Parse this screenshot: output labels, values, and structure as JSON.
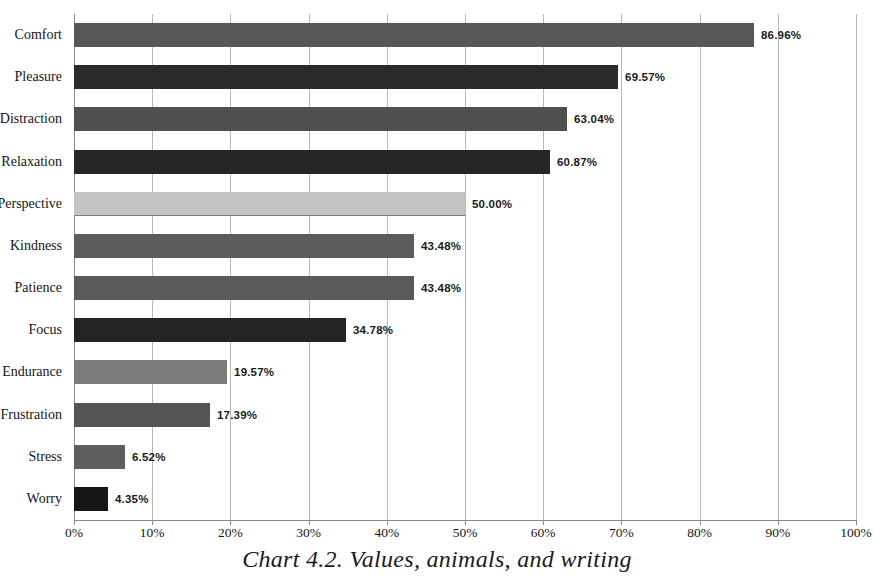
{
  "chart_data": {
    "type": "bar",
    "orientation": "horizontal",
    "title": "",
    "caption": "Chart 4.2. Values, animals, and writing",
    "xlabel": "",
    "ylabel": "",
    "xlim": [
      0,
      100
    ],
    "xtick_step": 10,
    "grid": true,
    "legend": "none",
    "value_suffix": "%",
    "xticks": [
      "0%",
      "10%",
      "20%",
      "30%",
      "40%",
      "50%",
      "60%",
      "70%",
      "80%",
      "90%",
      "100%"
    ],
    "xtick_values": [
      0,
      10,
      20,
      30,
      40,
      50,
      60,
      70,
      80,
      90,
      100
    ],
    "categories": [
      "Comfort",
      "Pleasure",
      "Distraction",
      "Relaxation",
      "Perspective",
      "Kindness",
      "Patience",
      "Focus",
      "Endurance",
      "Frustration",
      "Stress",
      "Worry"
    ],
    "values": [
      86.96,
      69.57,
      63.04,
      60.87,
      50.0,
      43.48,
      43.48,
      34.78,
      19.57,
      17.39,
      6.52,
      4.35
    ],
    "labels": [
      "86.96%",
      "69.57%",
      "63.04%",
      "60.87%",
      "50.00%",
      "43.48%",
      "43.48%",
      "34.78%",
      "19.57%",
      "17.39%",
      "6.52%",
      "4.35%"
    ],
    "bar_colors": [
      "#575757",
      "#2b2b2b",
      "#4f4f4f",
      "#262626",
      "#c4c4c4",
      "#5c5c5c",
      "#5a5a5a",
      "#232323",
      "#7c7c7c",
      "#555555",
      "#5e5e5e",
      "#161616"
    ],
    "bars": [
      {
        "category": "Comfort",
        "value": 86.96,
        "label": "86.96%",
        "color": "#575757"
      },
      {
        "category": "Pleasure",
        "value": 69.57,
        "label": "69.57%",
        "color": "#2b2b2b"
      },
      {
        "category": "Distraction",
        "value": 63.04,
        "label": "63.04%",
        "color": "#4f4f4f"
      },
      {
        "category": "Relaxation",
        "value": 60.87,
        "label": "60.87%",
        "color": "#262626"
      },
      {
        "category": "Perspective",
        "value": 50.0,
        "label": "50.00%",
        "color": "#c4c4c4"
      },
      {
        "category": "Kindness",
        "value": 43.48,
        "label": "43.48%",
        "color": "#5c5c5c"
      },
      {
        "category": "Patience",
        "value": 43.48,
        "label": "43.48%",
        "color": "#5a5a5a"
      },
      {
        "category": "Focus",
        "value": 34.78,
        "label": "34.78%",
        "color": "#232323"
      },
      {
        "category": "Endurance",
        "value": 19.57,
        "label": "19.57%",
        "color": "#7c7c7c"
      },
      {
        "category": "Frustration",
        "value": 17.39,
        "label": "17.39%",
        "color": "#555555"
      },
      {
        "category": "Stress",
        "value": 6.52,
        "label": "6.52%",
        "color": "#5e5e5e"
      },
      {
        "category": "Worry",
        "value": 4.35,
        "label": "4.35%",
        "color": "#161616"
      }
    ],
    "gridline_color": "#b8b8b8",
    "axis_color": "#8a8a8a"
  }
}
